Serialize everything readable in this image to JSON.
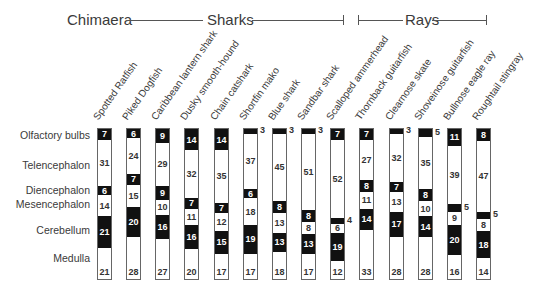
{
  "chart_data": {
    "type": "bar",
    "subtype": "100% stacked vertical bars",
    "title": "",
    "groups": [
      {
        "label": "Chimaera",
        "columns": [
          "Spotted Ratfish"
        ]
      },
      {
        "label": "Sharks",
        "columns": [
          "Piked Dogfish",
          "Caribbean lantern shark",
          "Dusky smooth-hound",
          "Chain catshark",
          "Shortfin mako",
          "Blue shark",
          "Sandbar shark",
          "Scalloped ammerhead"
        ]
      },
      {
        "label": "Rays",
        "columns": [
          "Thornback guitarfish",
          "Clearnose skate",
          "Shoveinose guitarfish",
          "Bullnose eagle ray",
          "Roughtail stingray"
        ]
      }
    ],
    "categories": [
      "Spotted Ratfish",
      "Piked Dogfish",
      "Caribbean lantern shark",
      "Dusky smooth-hound",
      "Chain catshark",
      "Shortfin mako",
      "Blue shark",
      "Sandbar shark",
      "Scalloped ammerhead",
      "Thornback guitarfish",
      "Clearnose skate",
      "Shoveinose guitarfish",
      "Bullnose eagle ray",
      "Roughtail stingray"
    ],
    "series": [
      {
        "name": "Olfactory bulbs",
        "shade": "dark",
        "values": [
          7,
          6,
          9,
          14,
          14,
          3,
          3,
          3,
          7,
          7,
          3,
          5,
          11,
          8
        ]
      },
      {
        "name": "Telencephalon",
        "shade": "light",
        "values": [
          31,
          24,
          29,
          32,
          35,
          37,
          45,
          51,
          52,
          27,
          32,
          35,
          39,
          47
        ]
      },
      {
        "name": "Diencephalon",
        "shade": "dark",
        "values": [
          6,
          7,
          9,
          7,
          7,
          6,
          8,
          8,
          4,
          8,
          7,
          8,
          5,
          5
        ]
      },
      {
        "name": "Mesencephalon",
        "shade": "light",
        "values": [
          14,
          15,
          10,
          11,
          12,
          18,
          13,
          8,
          6,
          11,
          13,
          10,
          9,
          8
        ]
      },
      {
        "name": "Cerebellum",
        "shade": "dark",
        "values": [
          21,
          20,
          16,
          16,
          15,
          19,
          13,
          13,
          19,
          14,
          17,
          14,
          20,
          18
        ]
      },
      {
        "name": "Medulla",
        "shade": "light",
        "values": [
          21,
          28,
          27,
          20,
          17,
          17,
          18,
          17,
          12,
          33,
          28,
          28,
          16,
          14
        ]
      }
    ],
    "xlabel": "",
    "ylabel": "",
    "ylim": [
      0,
      100
    ],
    "grid": false,
    "legend": "row labels on left",
    "colors": {
      "dark": "#111111",
      "light": "#ffffff",
      "border": "#666666"
    }
  },
  "header": {
    "chimaera": "Chimaera",
    "sharks": "Sharks",
    "rays": "Rays"
  },
  "row_labels": [
    "Olfactory bulbs",
    "Telencephalon",
    "Diencephalon",
    "Mesencephalon",
    "Cerebellum",
    "Medulla"
  ]
}
